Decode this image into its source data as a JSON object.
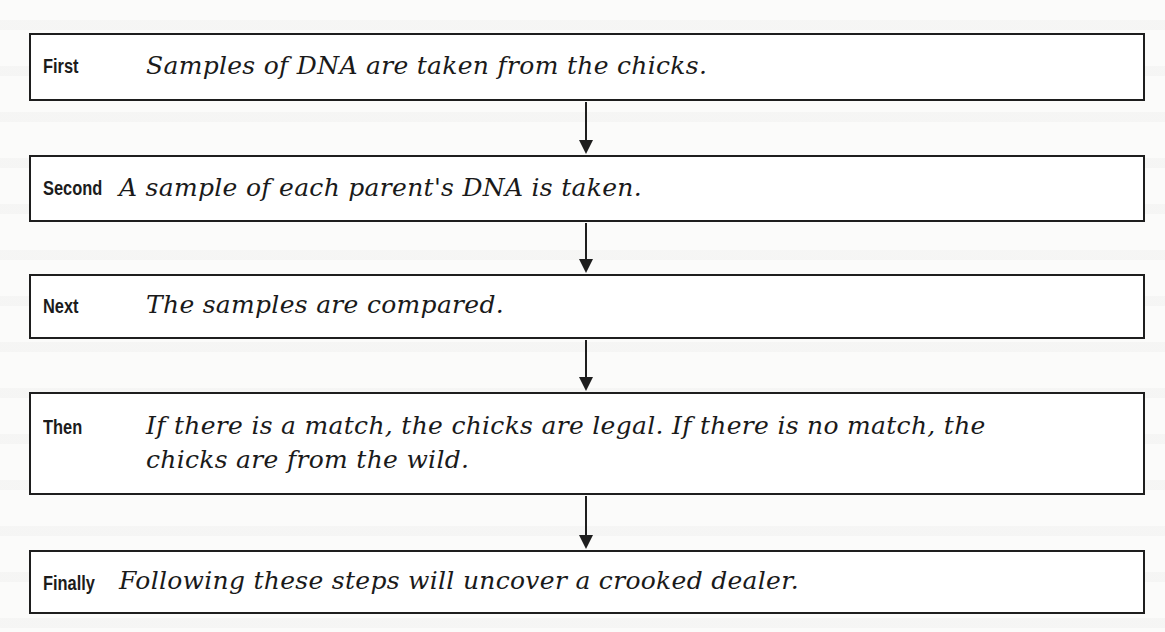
{
  "diagram": {
    "type": "sequence-flowchart",
    "steps": [
      {
        "label": "First",
        "text": "Samples of DNA are taken from the chicks."
      },
      {
        "label": "Second",
        "text": "A sample of each parent's DNA is taken."
      },
      {
        "label": "Next",
        "text": "The samples are compared."
      },
      {
        "label": "Then",
        "text_line1": "If there is a match, the chicks are legal. If there is no match, the",
        "text_line2": "chicks are from the wild."
      },
      {
        "label": "Finally",
        "text": "Following these steps will uncover a crooked dealer."
      }
    ],
    "connectors": [
      {
        "from": "First",
        "to": "Second",
        "icon": "down-arrow-icon"
      },
      {
        "from": "Second",
        "to": "Next",
        "icon": "down-arrow-icon"
      },
      {
        "from": "Next",
        "to": "Then",
        "icon": "down-arrow-icon"
      },
      {
        "from": "Then",
        "to": "Finally",
        "icon": "down-arrow-icon"
      }
    ],
    "colors": {
      "border": "#1e1e1e",
      "text": "#1a1a1a",
      "background": "#fbfbfa"
    }
  }
}
